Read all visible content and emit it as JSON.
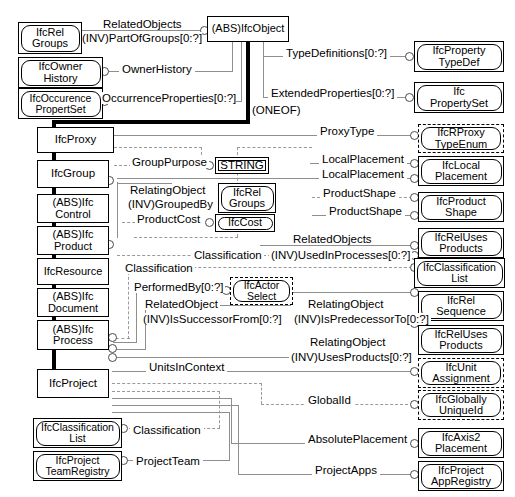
{
  "diagram": {
    "notation": "EXPRESS-G",
    "supertype_marker": "(ONEOF)",
    "colors": {
      "line": "#8e8e8e",
      "dashed_line": "#9a9a9a",
      "ink": "#000000",
      "background": "#ffffff"
    }
  },
  "entities": {
    "ifc_rel_groups_top": {
      "label": "IfcRel\nGroups"
    },
    "ifc_owner_history": {
      "label": "IfcOwner\nHistory"
    },
    "ifc_occurence_propertset": {
      "label": "IfcOccurence\nPropertSet"
    },
    "ifc_object": {
      "label": "(ABS)IfcObject"
    },
    "ifc_property_typedef": {
      "label": "IfcProperty\nTypeDef"
    },
    "ifc_propertyset": {
      "label": "Ifc\nPropertySet"
    },
    "ifc_proxy": {
      "label": "IfcProxy"
    },
    "ifc_group": {
      "label": "IfcGroup"
    },
    "ifc_control": {
      "label": "(ABS)Ifc\nControl"
    },
    "ifc_product": {
      "label": "(ABS)Ifc\nProduct"
    },
    "ifc_resource": {
      "label": "IfcResource"
    },
    "ifc_document": {
      "label": "(ABS)Ifc\nDocument"
    },
    "ifc_process": {
      "label": "(ABS)Ifc\nProcess"
    },
    "ifc_project": {
      "label": "IfcProject"
    },
    "string_type": {
      "label": "STRING"
    },
    "ifc_rel_groups_mid": {
      "label": "IfcRel\nGroups"
    },
    "ifc_cost": {
      "label": "IfcCost"
    },
    "ifc_actor_select": {
      "label": "IfcActor\nSelect"
    },
    "ifc_rproxy_typeenum": {
      "label": "IfcRProxy\nTypeEnum"
    },
    "ifc_local_placement": {
      "label": "IfcLocal\nPlacement"
    },
    "ifc_product_shape": {
      "label": "IfcProduct\nShape"
    },
    "ifc_rel_uses_products_1": {
      "label": "IfcRelUses\nProducts"
    },
    "ifc_classification_list_r": {
      "label": "IfcClassification\nList"
    },
    "ifc_rel_sequence": {
      "label": "IfcRel\nSequence"
    },
    "ifc_rel_uses_products_2": {
      "label": "IfcRelUses\nProducts"
    },
    "ifc_unit_assignment": {
      "label": "IfcUnit\nAssignment"
    },
    "ifc_globally_uniqueid": {
      "label": "IfcGlobally\nUniqueId"
    },
    "ifc_axis2_placement": {
      "label": "IfcAxis2\nPlacement"
    },
    "ifc_project_appregistry": {
      "label": "IfcProject\nAppRegistry"
    },
    "ifc_classification_list_b": {
      "label": "IfcClassification\nList"
    },
    "ifc_project_teamregistry": {
      "label": "IfcProject\nTeamRegistry"
    }
  },
  "attributes": {
    "related_objects_top": "RelatedObjects",
    "inv_part_of_groups": "(INV)PartOfGroups[0:?]",
    "owner_history": "OwnerHistory",
    "occurrence_properties": "OccurrenceProperties[0:?]",
    "type_definitions": "TypeDefinitions[0:?]",
    "extended_properties": "ExtendedProperties[0:?]",
    "oneof": "(ONEOF)",
    "proxy_type": "ProxyType",
    "group_purpose": "GroupPurpose",
    "local_placement_1": "LocalPlacement",
    "local_placement_2": "LocalPlacement",
    "relating_object_1": "RelatingObject",
    "inv_grouped_by": "(INV)GroupedBy",
    "product_cost": "ProductCost",
    "product_shape_1": "ProductShape",
    "product_shape_2": "ProductShape",
    "related_objects_mid": "RelatedObjects",
    "inv_used_in_processes": "(INV)UsedInProcesses[0:?]",
    "classification_1": "Classification",
    "classification_2": "Classification",
    "performed_by": "PerformedBy[0:?]",
    "related_object": "RelatedObject",
    "inv_is_successor_from": "(INV)IsSuccessorFrom[0:?]",
    "relating_object_2": "RelatingObject",
    "inv_is_predecessor_to": "(INV)IsPredecessorTo[0:?]",
    "relating_object_3": "RelatingObject",
    "inv_uses_products": "(INV)UsesProducts[0:?]",
    "units_in_context": "UnitsInContext",
    "global_id": "GlobalId",
    "absolute_placement": "AbsolutePlacement",
    "project_apps": "ProjectApps",
    "classification_bottom": "Classification",
    "project_team": "ProjectTeam"
  }
}
